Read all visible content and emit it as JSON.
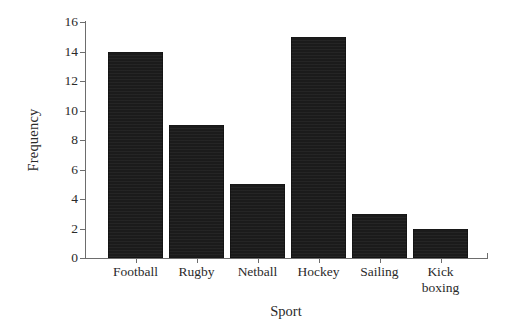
{
  "chart_data": {
    "type": "bar",
    "title": "",
    "xlabel": "Sport",
    "ylabel": "Frequency",
    "categories": [
      "Football",
      "Rugby",
      "Netball",
      "Hockey",
      "Sailing",
      "Kick boxing"
    ],
    "category_lines": [
      [
        "Football"
      ],
      [
        "Rugby"
      ],
      [
        "Netball"
      ],
      [
        "Hockey"
      ],
      [
        "Sailing"
      ],
      [
        "Kick",
        "boxing"
      ]
    ],
    "values": [
      14,
      9,
      5,
      15,
      3,
      2
    ],
    "ylim": [
      0,
      16
    ],
    "ytick_labels": [
      "0",
      "2",
      "4",
      "6",
      "8",
      "10",
      "12",
      "14",
      "16"
    ],
    "ytick_values": [
      0,
      2,
      4,
      6,
      8,
      10,
      12,
      14,
      16
    ],
    "grid": false,
    "legend": false,
    "bar_color": "#1b1b1b",
    "axis_color": "#6d6d6d",
    "background_color": "#ffffff"
  }
}
